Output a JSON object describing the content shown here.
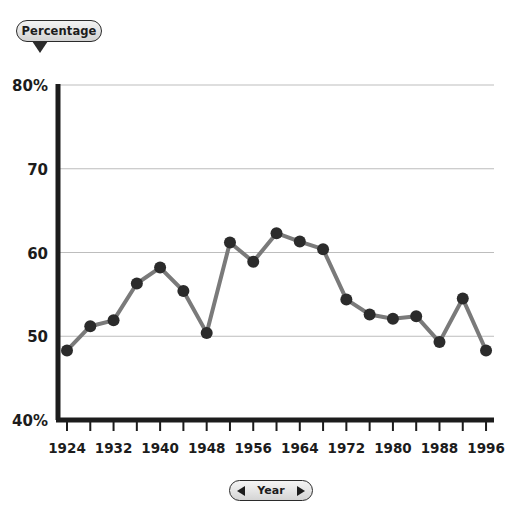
{
  "header": {
    "pill_label": "Percentage",
    "pill_icon": "pointer-down-triangle"
  },
  "footer": {
    "year_label": "Year",
    "prev_icon": "triangle-left-icon",
    "next_icon": "triangle-right-icon"
  },
  "colors": {
    "line": "#7a7a7a",
    "marker": "#2b2b2b",
    "axis": "#1c1c1c",
    "grid": "#bdbdbd",
    "background": "#ffffff",
    "pill_border": "#2b2b2b"
  },
  "chart_data": {
    "type": "line",
    "title": "",
    "xlabel": "Year",
    "ylabel": "Percentage",
    "ylim": [
      40,
      80
    ],
    "xlim": [
      1924,
      1996
    ],
    "grid": true,
    "legend": "none",
    "y_ticks": [
      "40%",
      "50",
      "60",
      "70",
      "80%"
    ],
    "y_tick_values": [
      40,
      50,
      60,
      70,
      80
    ],
    "x_ticks": [
      "1924",
      "1932",
      "1940",
      "1948",
      "1956",
      "1964",
      "1972",
      "1980",
      "1988",
      "1996"
    ],
    "x_tick_values": [
      1924,
      1932,
      1940,
      1948,
      1956,
      1964,
      1972,
      1980,
      1988,
      1996
    ],
    "x_minor_tick_values": [
      1928,
      1936,
      1944,
      1952,
      1960,
      1968,
      1976,
      1984,
      1992
    ],
    "x": [
      1924,
      1928,
      1932,
      1936,
      1940,
      1944,
      1948,
      1952,
      1956,
      1960,
      1964,
      1968,
      1972,
      1976,
      1980,
      1984,
      1988,
      1992,
      1996
    ],
    "values": [
      48.3,
      51.2,
      51.9,
      56.3,
      58.2,
      55.4,
      50.4,
      61.2,
      58.9,
      62.3,
      61.3,
      60.4,
      54.4,
      52.6,
      52.1,
      52.4,
      49.3,
      54.5,
      48.3
    ],
    "series": [
      {
        "name": "Percentage",
        "values": [
          48.3,
          51.2,
          51.9,
          56.3,
          58.2,
          55.4,
          50.4,
          61.2,
          58.9,
          62.3,
          61.3,
          60.4,
          54.4,
          52.6,
          52.1,
          52.4,
          49.3,
          54.5,
          48.3
        ]
      }
    ],
    "marker": "circle",
    "marker_size": 6,
    "line_width": 4
  }
}
